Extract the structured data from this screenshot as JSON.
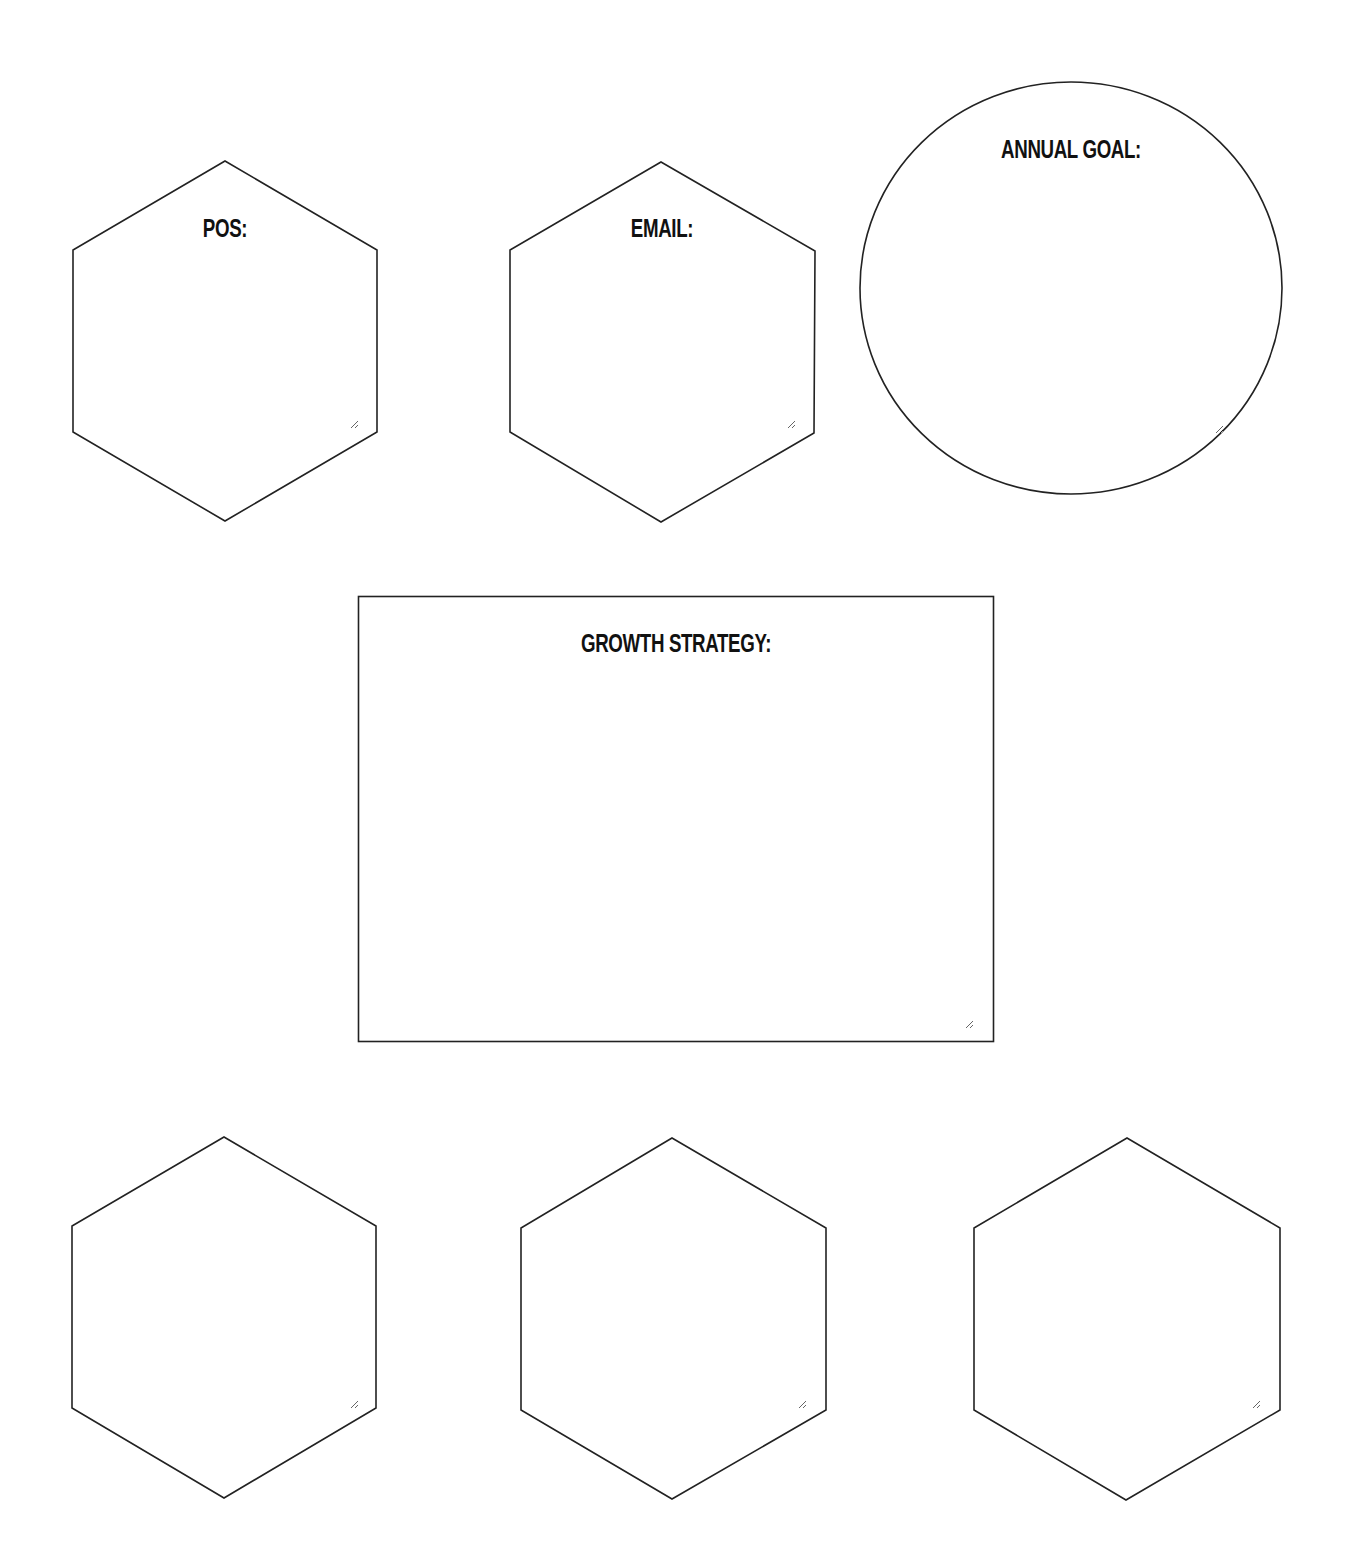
{
  "worksheet": {
    "pos": {
      "label": "POS:",
      "value": ""
    },
    "email": {
      "label": "EMAIL:",
      "value": ""
    },
    "annual_goal": {
      "label": "ANNUAL GOAL:",
      "value": ""
    },
    "growth_strategy": {
      "label": "GROWTH STRATEGY:",
      "value": ""
    },
    "bottom_hexagons": [
      {
        "value": ""
      },
      {
        "value": ""
      },
      {
        "value": ""
      }
    ]
  },
  "colors": {
    "stroke": "#222222",
    "text": "#111111",
    "background": "#ffffff"
  }
}
